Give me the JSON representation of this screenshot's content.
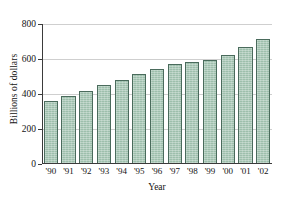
{
  "chart_data": {
    "type": "bar",
    "title": "",
    "xlabel": "Year",
    "ylabel": "Billions of dollars",
    "categories": [
      "'90",
      "'91",
      "'92",
      "'93",
      "'94",
      "'95",
      "'96",
      "'97",
      "'98",
      "'99",
      "'00",
      "'01",
      "'02"
    ],
    "values": [
      360,
      388,
      420,
      450,
      480,
      513,
      545,
      572,
      583,
      596,
      623,
      670,
      715
    ],
    "ylim": [
      0,
      800
    ],
    "yticks": [
      0,
      200,
      400,
      600,
      800
    ],
    "ytick_labels": [
      "0",
      "200",
      "400",
      "600",
      "800"
    ],
    "grid": true,
    "grid_axis": "y",
    "legend": false,
    "bar_color": "#9dbfac",
    "bar_edge_color": "#4a6b5c",
    "gridline_color": "#cfcfcf",
    "axis_color": "#3b3b3b",
    "background_color": "#ffffff"
  }
}
